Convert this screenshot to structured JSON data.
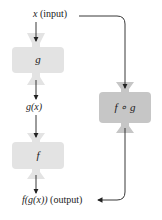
{
  "diagram": {
    "input_label": {
      "var": "x",
      "text": "(input)"
    },
    "box_g": {
      "label": "g",
      "fill": "#e3e3e3"
    },
    "intermediate_label": "g(x)",
    "box_f": {
      "label": "f",
      "fill": "#e3e3e3"
    },
    "output_label": {
      "expr": "f(g(x))",
      "text": "(output)"
    },
    "box_composite": {
      "label": "f ∘ g",
      "fill": "#c6c6c6"
    },
    "line_color": "#222222"
  }
}
